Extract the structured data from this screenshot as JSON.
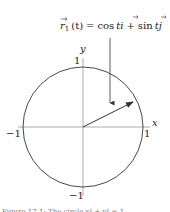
{
  "figure": {
    "label": "r1(t) = cos t i + sin t j",
    "label_parts": {
      "lhs_vec": "r",
      "lhs_sub": "1",
      "lhs_arg": "(t)",
      "eq": "=",
      "cos": "cos",
      "t1": "t",
      "i": "i",
      "plus": "+",
      "sin": "sin",
      "t2": "t",
      "j": "j"
    },
    "axes": {
      "x_label": "x",
      "y_label": "y",
      "x_pos_tick": "1",
      "x_neg_tick": "−1",
      "y_pos_tick": "1",
      "y_neg_tick": "−1"
    },
    "caption": "Figure 17.1: The circle x² + y² = 1"
  },
  "colors": {
    "curve": "#333333",
    "axis": "#666666",
    "text": "#222222"
  }
}
